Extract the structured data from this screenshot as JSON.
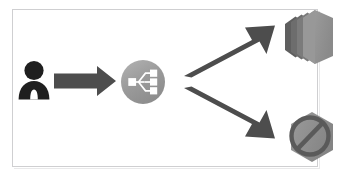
{
  "diagram": {
    "title": "Load balancer request distribution to instances",
    "type": "architecture-flow",
    "frame": {
      "border_color": "#cfcfd1",
      "background_color": "#ffffff"
    },
    "palette": {
      "arrow": "#4d4d4d",
      "user_silhouette": "#1f1f1f",
      "loadbalancer_circle": "#9a9a9a",
      "loadbalancer_glyph": "#ffffff",
      "instance_front": "#8f8f8f",
      "instance_back": "#6f6f6f",
      "stopped_body": "#8a8a8a",
      "stopped_symbol": "#5a5a5a"
    },
    "nodes": [
      {
        "id": "user",
        "label": "User",
        "icon": "user-icon",
        "position": "left-middle"
      },
      {
        "id": "loadbalancer",
        "label": "Load balancer",
        "icon": "load-balancer-icon",
        "position": "center-middle"
      },
      {
        "id": "instances",
        "label": "Running instances",
        "icon": "instance-stack-icon",
        "position": "right-top"
      },
      {
        "id": "stopped",
        "label": "Unavailable instance",
        "icon": "prohibited-instance-icon",
        "position": "right-bottom"
      }
    ],
    "arrows": [
      {
        "id": "user-to-loadbalancer",
        "from": "user",
        "to": "loadbalancer",
        "direction": "right",
        "label": ""
      },
      {
        "id": "loadbalancer-to-instances",
        "from": "loadbalancer",
        "to": "instances",
        "direction": "up-right",
        "label": ""
      },
      {
        "id": "loadbalancer-to-stopped",
        "from": "loadbalancer",
        "to": "stopped",
        "direction": "down-right",
        "label": ""
      }
    ]
  }
}
